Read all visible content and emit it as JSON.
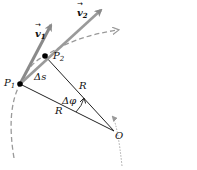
{
  "diagram": {
    "labels": {
      "v1": "v",
      "v1_sub": "1",
      "v2": "v",
      "v2_sub": "2",
      "p1": "P",
      "p1_sub": "1",
      "p2": "P",
      "p2_sub": "2",
      "delta_s": "Δs",
      "r_upper": "R",
      "r_lower": "R",
      "delta_phi": "Δφ",
      "origin": "O"
    },
    "colors": {
      "velocity_arrow": "#8a8a8a",
      "path": "#9a9a9a",
      "radius_line": "#222222",
      "point": "#000000"
    }
  }
}
